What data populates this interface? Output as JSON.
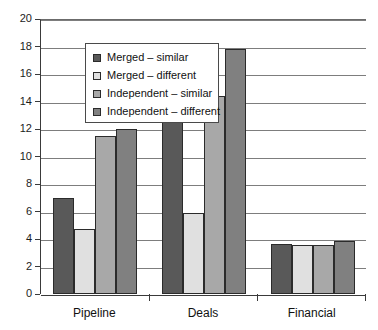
{
  "chart_data": {
    "type": "bar",
    "title": "",
    "xlabel": "",
    "ylabel": "",
    "ylim": [
      0,
      20
    ],
    "ytick_step": 2,
    "yticks": [
      20,
      18,
      16,
      14,
      12,
      10,
      8,
      6,
      4,
      2,
      0
    ],
    "grid": true,
    "legend_position": "upper left inside plot",
    "categories": [
      "Pipeline",
      "Deals",
      "Financial"
    ],
    "series": [
      {
        "name": "Merged – similar",
        "color": "#595959",
        "values": [
          7.0,
          12.5,
          3.65
        ]
      },
      {
        "name": "Merged – different",
        "color": "#e0e0e0",
        "values": [
          4.75,
          5.9,
          3.6
        ]
      },
      {
        "name": "Independent – similar",
        "color": "#a8a8a8",
        "values": [
          11.5,
          14.4,
          3.55
        ]
      },
      {
        "name": "Independent – different",
        "color": "#808080",
        "values": [
          12.0,
          17.8,
          3.85
        ]
      }
    ]
  },
  "axis": {
    "y_tick_labels": [
      "20",
      "18",
      "16",
      "14",
      "12",
      "10",
      "8",
      "6",
      "4",
      "2",
      "0"
    ],
    "x_tick_labels": [
      "Pipeline",
      "Deals",
      "Financial"
    ]
  },
  "legend": {
    "items": [
      {
        "label": "Merged – similar",
        "color": "#595959"
      },
      {
        "label": "Merged – different",
        "color": "#e0e0e0"
      },
      {
        "label": "Independent – similar",
        "color": "#a8a8a8"
      },
      {
        "label": "Independent – different",
        "color": "#808080"
      }
    ]
  },
  "style": {
    "axis_color": "#3a3a3a",
    "grid_color": "#7d7d7d",
    "bar_edge_color": "#2b2b2b",
    "background": "#ffffff",
    "text_color": "#111111"
  }
}
